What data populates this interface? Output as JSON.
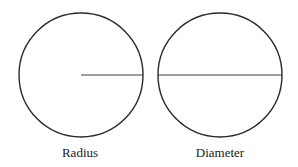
{
  "diagram": {
    "stroke_color": "#2a2a2a",
    "line_color": "#3a3a3a",
    "figures": [
      {
        "id": "radius",
        "label": "Radius",
        "circle": {
          "cx": 81,
          "cy": 75,
          "r": 62
        },
        "segment": {
          "x1": 81,
          "y1": 75,
          "x2": 143,
          "y2": 75
        },
        "label_pos": {
          "x": 80,
          "y": 157
        }
      },
      {
        "id": "diameter",
        "label": "Diameter",
        "circle": {
          "cx": 220,
          "cy": 75,
          "r": 62
        },
        "segment": {
          "x1": 158,
          "y1": 75,
          "x2": 282,
          "y2": 75
        },
        "label_pos": {
          "x": 220,
          "y": 157
        }
      }
    ]
  }
}
